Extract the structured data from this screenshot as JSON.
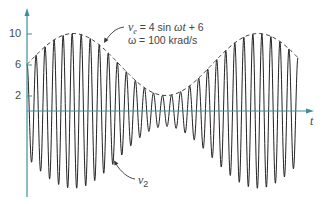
{
  "chart_data": {
    "type": "line",
    "title": "",
    "xlabel": "t",
    "ylabel": "",
    "yticks": [
      2,
      6,
      10
    ],
    "ylim": [
      -11,
      13
    ],
    "grid": false,
    "legend": null,
    "series": [
      {
        "name": "v2",
        "description": "Amplitude-modulated carrier; high-frequency oscillation whose peak amplitude follows the envelope ve",
        "envelope": "ve",
        "carrier_cycles_visible": 30
      },
      {
        "name": "ve",
        "description": "Dashed envelope curve",
        "expression": "4 sin ωt + 6",
        "min": 2,
        "max": 10,
        "value_at_t0": 6,
        "envelope_cycles_visible": 1.4
      }
    ],
    "annotations": [
      {
        "text": "ve = 4 sin ωt + 6",
        "target": "dashed envelope"
      },
      {
        "text": "ω = 100 krad/s",
        "target": "dashed envelope"
      },
      {
        "text": "v2",
        "target": "oscillating waveform"
      }
    ],
    "colors": {
      "axis": "#3f8f97",
      "waveform": "#222222",
      "envelope": "#444444"
    }
  },
  "axes": {
    "y_ticks": [
      {
        "label": "10"
      },
      {
        "label": "6"
      },
      {
        "label": "2"
      }
    ],
    "x_label": "t"
  },
  "annotations": {
    "ve_lhs_var": "v",
    "ve_lhs_sub": "e",
    "ve_rhs": " = 4 sin ",
    "ve_omega_t": "ωt",
    "ve_tail": " + 6",
    "omega_line": "ω = 100 krad/s",
    "v2_var": "v",
    "v2_sub": "2"
  }
}
